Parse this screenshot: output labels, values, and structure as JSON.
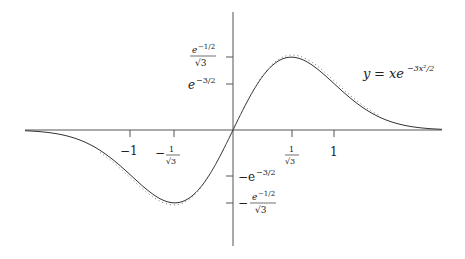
{
  "chart_data": {
    "type": "line",
    "title": "",
    "equation_label": "y = xe^{-3x^2/2}",
    "series": [
      {
        "name": "y = x e^{-3x^2/2} (solid)",
        "style": "solid",
        "function": "x*exp(-3x^2/2)"
      },
      {
        "name": "approximation (dotted)",
        "style": "dotted"
      }
    ],
    "x_ticks": [
      {
        "value": -1,
        "label": "−1"
      },
      {
        "value": -0.577,
        "label": "−1/√3"
      },
      {
        "value": 0.577,
        "label": "1/√3"
      },
      {
        "value": 1,
        "label": "1"
      }
    ],
    "y_ticks": [
      {
        "value": 0.35,
        "label": "e^{−1/2}/√3"
      },
      {
        "value": 0.223,
        "label": "e^{−3/2}"
      },
      {
        "value": -0.223,
        "label": "−e^{−3/2}"
      },
      {
        "value": -0.35,
        "label": "−e^{−1/2}/√3"
      }
    ],
    "xlim": [
      -2.0,
      2.3
    ],
    "ylim": [
      -0.56,
      0.57
    ],
    "grid": false,
    "legend": "none",
    "key_points": [
      {
        "x": -0.577,
        "y": -0.35,
        "note": "minimum"
      },
      {
        "x": 0,
        "y": 0
      },
      {
        "x": 0.577,
        "y": 0.35,
        "note": "maximum"
      }
    ]
  },
  "labels": {
    "equation_y": "y",
    "equation_eq": "= ",
    "equation_x": "xe",
    "equation_exp": "−3x²/2",
    "x_neg1": "−1",
    "x_neg_inv_sqrt3_num": "1",
    "x_neg_inv_sqrt3_den": "√3",
    "x_pos_inv_sqrt3_num": "1",
    "x_pos_inv_sqrt3_den": "√3",
    "x_pos1": "1",
    "y_max_num": "e",
    "y_max_num_exp": "−1/2",
    "y_max_den": "√3",
    "y_e32": "e",
    "y_e32_exp": "−3/2",
    "y_neg_e32": "−e",
    "y_neg_e32_exp": "−3/2",
    "y_min_num": "e",
    "y_min_num_exp": "−1/2",
    "y_min_den": "√3",
    "minus": "−"
  }
}
